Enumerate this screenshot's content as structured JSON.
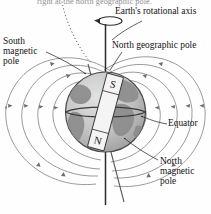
{
  "figure": {
    "caption_top": "right at the north geographic pole.",
    "labels": {
      "rotational_axis": "Earth's rotational axis",
      "north_geographic_pole": "North geographic pole",
      "south_magnetic_pole": "South\nmagnetic\npole",
      "equator": "Equator",
      "north_magnetic_pole": "North\nmagnetic\npole"
    },
    "magnet": {
      "south_end": "S",
      "north_end": "N",
      "tilt_degrees": 18
    },
    "colors": {
      "ink": "#141414",
      "field_line": "#6f6f6f",
      "ocean": "#bdbdbd",
      "land": "#8f8f8f",
      "globe_edge": "#4a4a4a",
      "magnet_body": "#f2f2f2",
      "caption_gray": "#8e8e8e"
    }
  }
}
